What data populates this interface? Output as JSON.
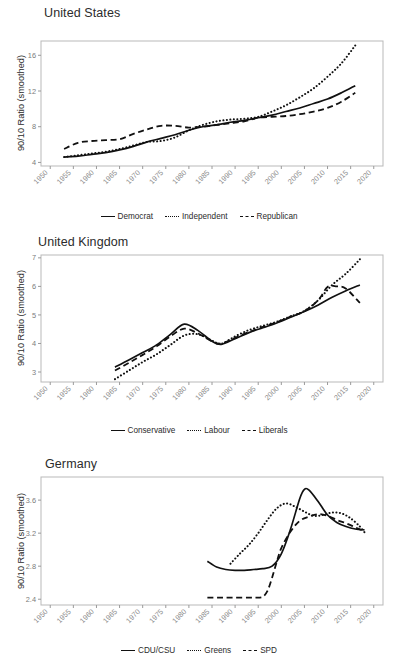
{
  "figure": {
    "ylabel": "90/10 Ratio (smoothed)",
    "panels": [
      "united-states",
      "united-kingdom",
      "germany"
    ]
  },
  "chart_data": [
    {
      "type": "line",
      "title": "United States",
      "xlabel": "",
      "ylabel": "90/10 Ratio (smoothed)",
      "xlim": [
        1948,
        2022
      ],
      "ylim": [
        3.6,
        17.6
      ],
      "xticks": [
        1950,
        1955,
        1960,
        1965,
        1970,
        1975,
        1980,
        1985,
        1990,
        1995,
        2000,
        2005,
        2010,
        2015,
        2020
      ],
      "yticks": [
        4,
        8,
        12,
        16
      ],
      "grid": false,
      "legend_position": "bottom",
      "series": [
        {
          "name": "Democrat",
          "style": "solid",
          "x": [
            1953,
            1956,
            1959,
            1962,
            1965,
            1968,
            1971,
            1974,
            1977,
            1980,
            1983,
            1986,
            1989,
            1992,
            1995,
            1998,
            2001,
            2004,
            2007,
            2010,
            2013,
            2016
          ],
          "y": [
            4.6,
            4.7,
            4.9,
            5.1,
            5.4,
            5.8,
            6.3,
            6.7,
            7.1,
            7.6,
            8.0,
            8.2,
            8.5,
            8.7,
            9.0,
            9.3,
            9.7,
            10.1,
            10.6,
            11.1,
            11.8,
            12.6
          ]
        },
        {
          "name": "Independent",
          "style": "dotted",
          "x": [
            1953,
            1956,
            1959,
            1962,
            1965,
            1968,
            1971,
            1974,
            1977,
            1980,
            1983,
            1986,
            1989,
            1992,
            1995,
            1998,
            2001,
            2004,
            2007,
            2010,
            2013,
            2016
          ],
          "y": [
            4.6,
            4.8,
            5.0,
            5.2,
            5.5,
            5.9,
            6.3,
            6.4,
            6.8,
            7.6,
            8.2,
            8.6,
            8.8,
            8.9,
            9.1,
            9.7,
            10.4,
            11.3,
            12.3,
            13.6,
            15.1,
            17.1
          ]
        },
        {
          "name": "Republican",
          "style": "dashed",
          "x": [
            1953,
            1956,
            1959,
            1962,
            1965,
            1968,
            1971,
            1974,
            1977,
            1980,
            1983,
            1986,
            1989,
            1992,
            1995,
            1998,
            2001,
            2004,
            2007,
            2010,
            2013,
            2016
          ],
          "y": [
            5.5,
            6.2,
            6.4,
            6.5,
            6.6,
            7.2,
            7.7,
            8.1,
            8.1,
            7.9,
            8.0,
            8.2,
            8.4,
            8.6,
            9.0,
            9.1,
            9.2,
            9.4,
            9.7,
            10.1,
            10.8,
            11.8
          ]
        }
      ]
    },
    {
      "type": "line",
      "title": "United Kingdom",
      "xlabel": "",
      "ylabel": "90/10 Ratio (smoothed)",
      "xlim": [
        1948,
        2022
      ],
      "ylim": [
        2.65,
        7.1
      ],
      "xticks": [
        1950,
        1955,
        1960,
        1965,
        1970,
        1975,
        1980,
        1985,
        1990,
        1995,
        2000,
        2005,
        2010,
        2015,
        2020
      ],
      "yticks": [
        3,
        4,
        5,
        6,
        7
      ],
      "grid": false,
      "legend_position": "bottom",
      "series": [
        {
          "name": "Conservative",
          "style": "solid",
          "x": [
            1964,
            1967,
            1970,
            1973,
            1976,
            1979,
            1982,
            1985,
            1987,
            1990,
            1993,
            1996,
            1999,
            2002,
            2005,
            2008,
            2011,
            2014,
            2017
          ],
          "y": [
            3.17,
            3.42,
            3.68,
            3.95,
            4.32,
            4.68,
            4.45,
            4.08,
            3.97,
            4.17,
            4.38,
            4.55,
            4.72,
            4.92,
            5.12,
            5.35,
            5.62,
            5.85,
            6.05
          ]
        },
        {
          "name": "Labour",
          "style": "dotted",
          "x": [
            1964,
            1967,
            1970,
            1973,
            1976,
            1979,
            1982,
            1985,
            1987,
            1990,
            1993,
            1996,
            1999,
            2002,
            2005,
            2008,
            2011,
            2014,
            2017
          ],
          "y": [
            2.75,
            3.05,
            3.35,
            3.62,
            3.95,
            4.28,
            4.32,
            4.1,
            3.99,
            4.25,
            4.47,
            4.62,
            4.76,
            4.95,
            5.14,
            5.52,
            6.05,
            6.45,
            6.95
          ]
        },
        {
          "name": "Liberals",
          "style": "dashed",
          "x": [
            1964,
            1967,
            1970,
            1973,
            1976,
            1979,
            1982,
            1985,
            1987,
            1990,
            1993,
            1996,
            1999,
            2002,
            2005,
            2008,
            2010,
            2012,
            2014,
            2017
          ],
          "y": [
            3.05,
            3.32,
            3.6,
            3.9,
            4.25,
            4.52,
            4.35,
            4.07,
            4.0,
            4.2,
            4.4,
            4.58,
            4.74,
            4.94,
            5.13,
            5.52,
            5.98,
            6.0,
            5.92,
            5.42
          ]
        }
      ]
    },
    {
      "type": "line",
      "title": "Germany",
      "xlabel": "",
      "ylabel": "90/10 Ratio (smoothed)",
      "xlim": [
        1948,
        2022
      ],
      "ylim": [
        2.33,
        3.88
      ],
      "xticks": [
        1950,
        1955,
        1960,
        1965,
        1970,
        1975,
        1980,
        1985,
        1990,
        1995,
        2000,
        2005,
        2010,
        2015,
        2020
      ],
      "yticks": [
        2.4,
        2.8,
        3.2,
        3.6
      ],
      "grid": false,
      "legend_position": "bottom",
      "series": [
        {
          "name": "CDU/CSU",
          "style": "solid",
          "x": [
            1984,
            1986,
            1988,
            1990,
            1992,
            1994,
            1996,
            1998,
            2000,
            2002,
            2004,
            2005,
            2006,
            2008,
            2010,
            2012,
            2014,
            2016,
            2018
          ],
          "y": [
            2.86,
            2.79,
            2.76,
            2.75,
            2.75,
            2.76,
            2.77,
            2.8,
            2.95,
            3.25,
            3.62,
            3.73,
            3.72,
            3.58,
            3.42,
            3.33,
            3.28,
            3.25,
            3.24
          ]
        },
        {
          "name": "Greens",
          "style": "dotted",
          "x": [
            1989,
            1991,
            1993,
            1995,
            1997,
            1999,
            2001,
            2003,
            2005,
            2007,
            2009,
            2011,
            2013,
            2015,
            2017,
            2018
          ],
          "y": [
            2.83,
            2.95,
            3.06,
            3.2,
            3.36,
            3.5,
            3.56,
            3.52,
            3.46,
            3.41,
            3.42,
            3.45,
            3.44,
            3.38,
            3.28,
            3.21
          ]
        },
        {
          "name": "SPD",
          "style": "dashed",
          "x": [
            1984,
            1987,
            1990,
            1993,
            1995,
            1996,
            1997,
            1998,
            1999,
            2000,
            2002,
            2004,
            2006,
            2008,
            2010,
            2012,
            2014,
            2016,
            2018
          ],
          "y": [
            2.42,
            2.42,
            2.42,
            2.42,
            2.42,
            2.43,
            2.5,
            2.66,
            2.85,
            3.02,
            3.22,
            3.35,
            3.4,
            3.43,
            3.41,
            3.36,
            3.32,
            3.27,
            3.22
          ]
        }
      ]
    }
  ],
  "legends": [
    {
      "entries": [
        {
          "label": "Democrat",
          "style": "solid"
        },
        {
          "label": "Independent",
          "style": "dotted"
        },
        {
          "label": "Republican",
          "style": "dashed"
        }
      ]
    },
    {
      "entries": [
        {
          "label": "Conservative",
          "style": "solid"
        },
        {
          "label": "Labour",
          "style": "dotted"
        },
        {
          "label": "Liberals",
          "style": "dashed"
        }
      ]
    },
    {
      "entries": [
        {
          "label": "CDU/CSU",
          "style": "solid"
        },
        {
          "label": "Greens",
          "style": "dotted"
        },
        {
          "label": "SPD",
          "style": "dashed"
        }
      ]
    }
  ]
}
